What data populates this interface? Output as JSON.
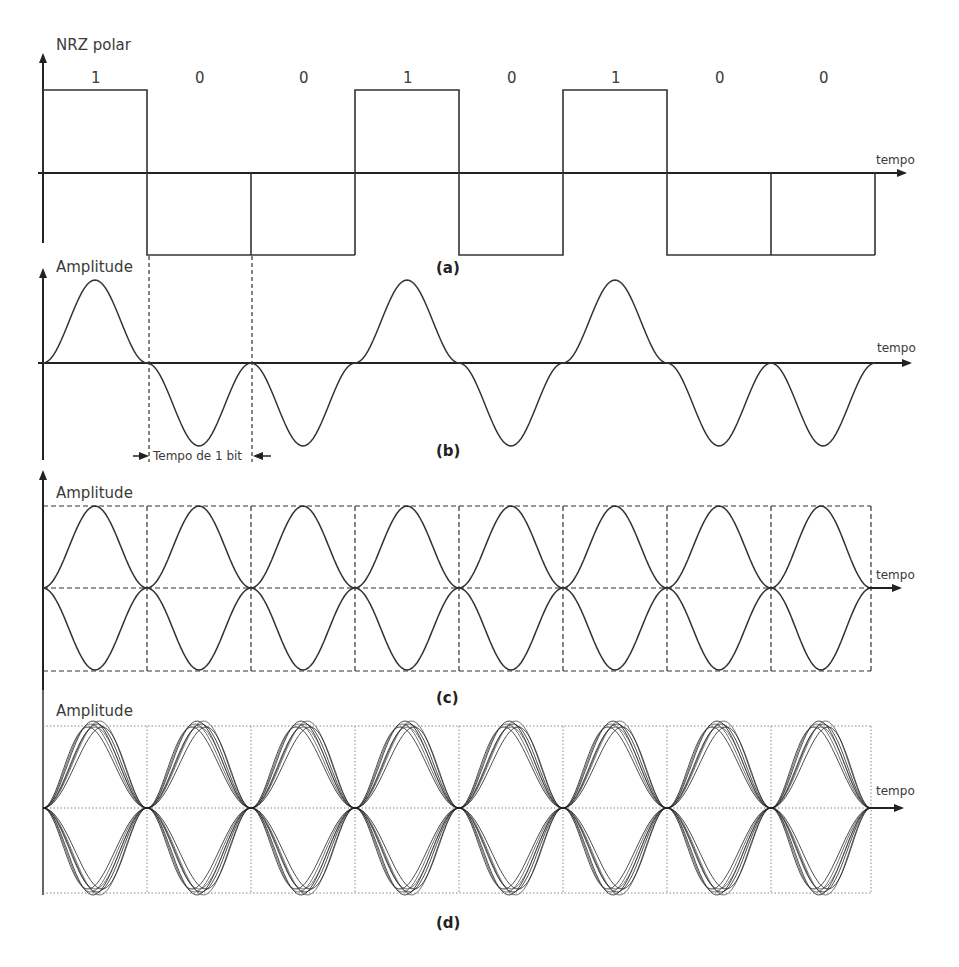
{
  "figure": {
    "panels": [
      {
        "id": "a",
        "caption": "(a)",
        "y_label": "NRZ polar",
        "x_label": "tempo",
        "bits": [
          "1",
          "0",
          "0",
          "1",
          "0",
          "1",
          "0",
          "0"
        ]
      },
      {
        "id": "b",
        "caption": "(b)",
        "y_label": "Amplitude",
        "x_label": "tempo",
        "annotation": "Tempo de 1 bit"
      },
      {
        "id": "c",
        "caption": "(c)",
        "y_label": "Amplitude",
        "x_label": "tempo"
      },
      {
        "id": "d",
        "caption": "(d)",
        "y_label": "Amplitude",
        "x_label": "tempo"
      }
    ]
  },
  "chart_data": [
    {
      "type": "line",
      "title": "NRZ polar",
      "xlabel": "tempo",
      "ylabel": "NRZ polar",
      "categories": [
        "1",
        "0",
        "0",
        "1",
        "0",
        "1",
        "0",
        "0"
      ],
      "values": [
        1,
        -1,
        -1,
        1,
        -1,
        1,
        -1,
        -1
      ],
      "caption": "(a)"
    },
    {
      "type": "line",
      "title": "",
      "xlabel": "tempo",
      "ylabel": "Amplitude",
      "categories": [
        "1",
        "0",
        "0",
        "1",
        "0",
        "1",
        "0",
        "0"
      ],
      "values": [
        1,
        -1,
        -1,
        1,
        -1,
        1,
        -1,
        -1
      ],
      "annotation": "Tempo de 1 bit",
      "caption": "(b)"
    },
    {
      "type": "line",
      "title": "",
      "xlabel": "tempo",
      "ylabel": "Amplitude",
      "bit_periods": 8,
      "caption": "(c)"
    },
    {
      "type": "line",
      "title": "",
      "xlabel": "tempo",
      "ylabel": "Amplitude",
      "bit_periods": 8,
      "caption": "(d)"
    }
  ]
}
